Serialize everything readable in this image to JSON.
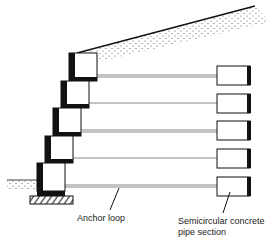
{
  "diagram": {
    "type": "cross-section",
    "labels": {
      "anchor_loop": "Anchor loop",
      "pipe_section_line1": "Semicircular concrete",
      "pipe_section_line2": "pipe section"
    },
    "colors": {
      "ink": "#111111",
      "tie": "#888888",
      "background": "#ffffff"
    },
    "wall_blocks": [
      {
        "x": 69,
        "y": 53,
        "w": 28,
        "h": 28
      },
      {
        "x": 61,
        "y": 81,
        "w": 28,
        "h": 27
      },
      {
        "x": 53,
        "y": 108,
        "w": 28,
        "h": 28
      },
      {
        "x": 45,
        "y": 136,
        "w": 28,
        "h": 27
      },
      {
        "x": 37,
        "y": 163,
        "w": 28,
        "h": 28
      }
    ],
    "anchor_rows_y": [
      76,
      104,
      131,
      159,
      186
    ],
    "pipe_sections": [
      {
        "x": 217,
        "y": 66,
        "w": 33,
        "h": 19
      },
      {
        "x": 217,
        "y": 94,
        "w": 33,
        "h": 19
      },
      {
        "x": 217,
        "y": 121,
        "w": 33,
        "h": 19
      },
      {
        "x": 217,
        "y": 149,
        "w": 33,
        "h": 19
      },
      {
        "x": 217,
        "y": 177,
        "w": 33,
        "h": 19
      }
    ]
  }
}
